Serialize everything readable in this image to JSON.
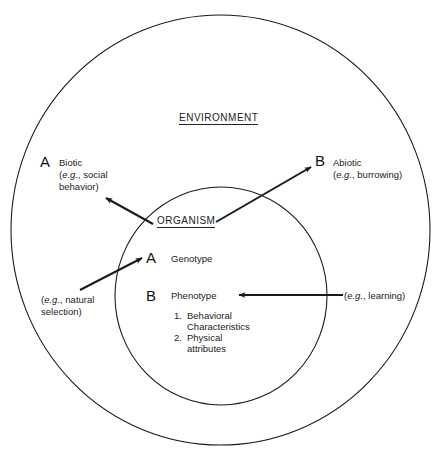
{
  "diagram": {
    "outer_label": "ENVIRONMENT",
    "inner_label": "ORGANISM",
    "environment": {
      "a": {
        "letter": "A",
        "title": "Biotic",
        "eg_prefix": "e.g.",
        "eg_text": ", social",
        "eg_text2": "behavior)"
      },
      "b": {
        "letter": "B",
        "title": "Abiotic",
        "eg_prefix": "e.g.",
        "eg_text": ", burrowing)"
      }
    },
    "organism": {
      "a": {
        "letter": "A",
        "title": "Genotype"
      },
      "b": {
        "letter": "B",
        "title": "Phenotype",
        "items": [
          {
            "num": "1.",
            "line1": "Behavioral",
            "line2": "Characteristics"
          },
          {
            "num": "2.",
            "line1": "Physical",
            "line2": "attributes"
          }
        ]
      }
    },
    "influences": {
      "genotype": {
        "eg_prefix": "e.g.",
        "eg_text": ", natural",
        "eg_text2": "selection)"
      },
      "phenotype": {
        "eg_prefix": "e.g.",
        "eg_text": ", learning)"
      }
    },
    "colors": {
      "line": "#1a1a1a",
      "background": "#ffffff"
    }
  }
}
